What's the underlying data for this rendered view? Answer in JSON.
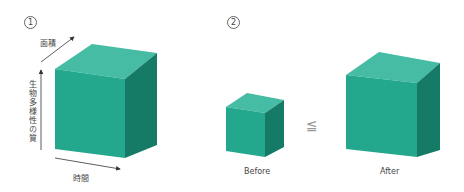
{
  "panel1": {
    "number": "1",
    "axis_area": "面積",
    "axis_quality": "生物多様性の質",
    "axis_time": "時間"
  },
  "panel2": {
    "number": "2",
    "before_label": "Before",
    "after_label": "After",
    "relation": "≦"
  },
  "colors": {
    "front": "#23a88e",
    "top": "#45bca3",
    "side": "#157a66"
  }
}
